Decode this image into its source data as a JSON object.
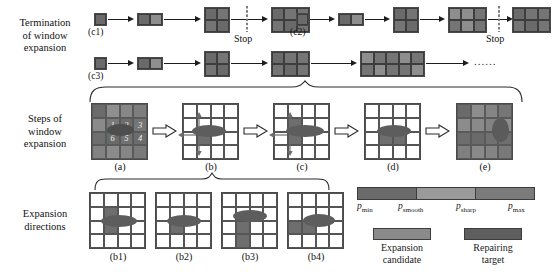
{
  "figure": {
    "row_labels": [
      {
        "id": "termination",
        "text": "Termination\nof window\nexpansion"
      },
      {
        "id": "steps",
        "text": "Steps of\nwindow\nexpansion"
      },
      {
        "id": "directions",
        "text": "Expansion\ndirections"
      }
    ],
    "termination": {
      "stop_label_1": "Stop",
      "stop_label_2": "Stop",
      "ellipsis": "......",
      "chains": [
        {
          "id": "c1",
          "caption": "(c1)",
          "stages": [
            "1x1",
            "1x2",
            "2x2",
            "2x3"
          ],
          "stop_after_index": 2
        },
        {
          "id": "c2",
          "caption": "(c2)",
          "stages": [
            "1x1",
            "1x2",
            "2x2",
            "2x3",
            "2x3"
          ],
          "stop_after_index": 3
        },
        {
          "id": "c3",
          "caption": "(c3)",
          "stages": [
            "1x1",
            "1x2",
            "2x2",
            "2x3",
            "2x4",
            "2x5"
          ],
          "stop_after_index": -1
        }
      ]
    },
    "steps": {
      "panels": [
        {
          "id": "a",
          "caption": "(a)",
          "numbers": [
            "1",
            "2",
            "3",
            "6",
            "5",
            "4"
          ]
        },
        {
          "id": "b",
          "caption": "(b)"
        },
        {
          "id": "c",
          "caption": "(c)"
        },
        {
          "id": "d",
          "caption": "(d)"
        },
        {
          "id": "e",
          "caption": "(e)"
        }
      ]
    },
    "directions": {
      "panels": [
        {
          "id": "b1",
          "caption": "(b1)"
        },
        {
          "id": "b2",
          "caption": "(b2)"
        },
        {
          "id": "b3",
          "caption": "(b3)"
        },
        {
          "id": "b4",
          "caption": "(b4)"
        }
      ]
    },
    "legend": {
      "colorbar": {
        "segments": [
          "#6a6a6a",
          "#9a9a9a",
          "#7b7b7b"
        ],
        "ticks": [
          {
            "base": "p",
            "sub": "min"
          },
          {
            "base": "p",
            "sub": "smooth"
          },
          {
            "base": "p",
            "sub": "sharp"
          },
          {
            "base": "p",
            "sub": "max"
          }
        ]
      },
      "keys": [
        {
          "id": "expansion-candidate",
          "color": "#8b8b8b",
          "label": "Expansion\ncandidate"
        },
        {
          "id": "repairing-target",
          "color": "#5e5e5e",
          "label": "Repairing\ntarget"
        }
      ]
    }
  }
}
